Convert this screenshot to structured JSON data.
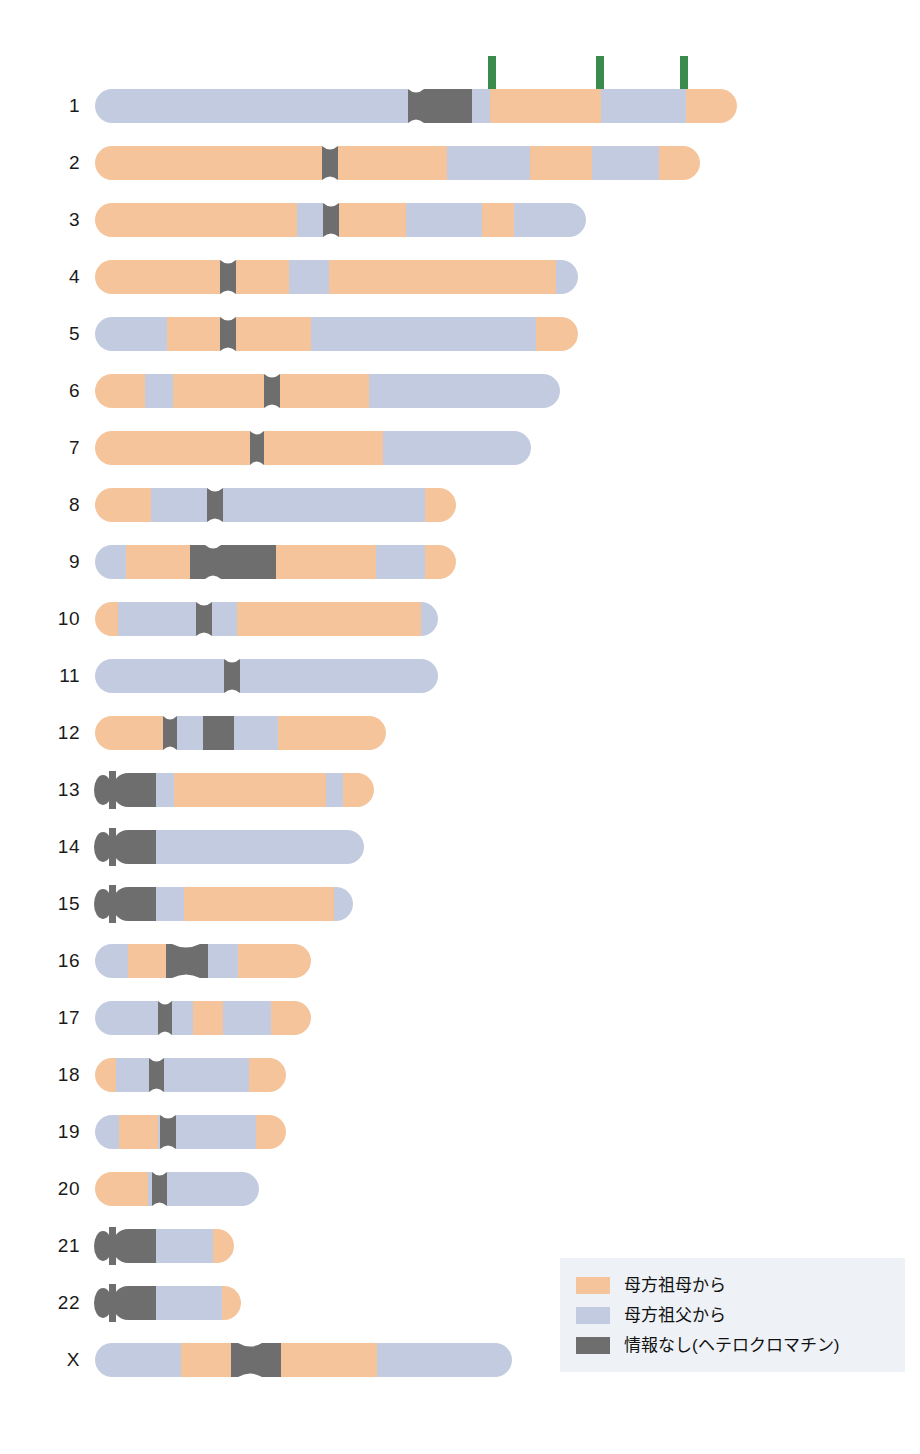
{
  "figure": {
    "type": "chromosome-ideogram-karyogram",
    "title": "",
    "background": "#ffffff"
  },
  "colors": {
    "maternal_grandmother": "#F5C49B",
    "maternal_grandfather": "#C2CBDF",
    "no_information": "#6E6E6E",
    "arrow": "#3C8B4E",
    "label_text": "#1a1a1a",
    "legend_background": "#eef1f5"
  },
  "legend": {
    "items": [
      {
        "swatch": "maternal_grandmother",
        "label": "母方祖母から"
      },
      {
        "swatch": "maternal_grandfather",
        "label": "母方祖父から"
      },
      {
        "swatch": "no_information",
        "label": "情報なし(ヘテロクロマチン)"
      }
    ]
  },
  "arrows": {
    "count": 3,
    "direction": "down",
    "points_at_chromosome": "1",
    "x_positions": [
      492,
      600,
      684
    ],
    "top": 56,
    "length": 50
  },
  "chart_data": {
    "type": "bar",
    "title": "",
    "xlabel": "",
    "ylabel": "",
    "categories": [
      "1",
      "2",
      "3",
      "4",
      "5",
      "6",
      "7",
      "8",
      "9",
      "10",
      "11",
      "12",
      "13",
      "14",
      "15",
      "16",
      "17",
      "18",
      "19",
      "20",
      "21",
      "22",
      "X"
    ],
    "note": "Each chromosome drawn to scale as a horizontal bar; bands give parental origin of each segment."
  },
  "chromosomes": [
    {
      "name": "1",
      "y": 106,
      "x0": 95,
      "x1": 737,
      "acrocentric": false,
      "centromere": {
        "start": 408,
        "end": 424
      },
      "bands": [
        {
          "from": 95,
          "to": 408,
          "color": "maternal_grandfather"
        },
        {
          "from": 408,
          "to": 472,
          "color": "no_information"
        },
        {
          "from": 472,
          "to": 490,
          "color": "maternal_grandfather"
        },
        {
          "from": 490,
          "to": 601,
          "color": "maternal_grandmother"
        },
        {
          "from": 601,
          "to": 686,
          "color": "maternal_grandfather"
        },
        {
          "from": 686,
          "to": 737,
          "color": "maternal_grandmother"
        }
      ]
    },
    {
      "name": "2",
      "y": 163,
      "x0": 95,
      "x1": 700,
      "acrocentric": false,
      "centromere": {
        "start": 322,
        "end": 338
      },
      "bands": [
        {
          "from": 95,
          "to": 322,
          "color": "maternal_grandmother"
        },
        {
          "from": 322,
          "to": 338,
          "color": "no_information"
        },
        {
          "from": 338,
          "to": 447,
          "color": "maternal_grandmother"
        },
        {
          "from": 447,
          "to": 530,
          "color": "maternal_grandfather"
        },
        {
          "from": 530,
          "to": 592,
          "color": "maternal_grandmother"
        },
        {
          "from": 592,
          "to": 659,
          "color": "maternal_grandfather"
        },
        {
          "from": 659,
          "to": 700,
          "color": "maternal_grandmother"
        }
      ]
    },
    {
      "name": "3",
      "y": 220,
      "x0": 95,
      "x1": 586,
      "acrocentric": false,
      "centromere": {
        "start": 323,
        "end": 339
      },
      "bands": [
        {
          "from": 95,
          "to": 297,
          "color": "maternal_grandmother"
        },
        {
          "from": 297,
          "to": 323,
          "color": "maternal_grandfather"
        },
        {
          "from": 323,
          "to": 339,
          "color": "no_information"
        },
        {
          "from": 339,
          "to": 406,
          "color": "maternal_grandmother"
        },
        {
          "from": 406,
          "to": 482,
          "color": "maternal_grandfather"
        },
        {
          "from": 482,
          "to": 514,
          "color": "maternal_grandmother"
        },
        {
          "from": 514,
          "to": 586,
          "color": "maternal_grandfather"
        }
      ]
    },
    {
      "name": "4",
      "y": 277,
      "x0": 95,
      "x1": 578,
      "acrocentric": false,
      "centromere": {
        "start": 220,
        "end": 236
      },
      "bands": [
        {
          "from": 95,
          "to": 220,
          "color": "maternal_grandmother"
        },
        {
          "from": 220,
          "to": 236,
          "color": "no_information"
        },
        {
          "from": 236,
          "to": 289,
          "color": "maternal_grandmother"
        },
        {
          "from": 289,
          "to": 329,
          "color": "maternal_grandfather"
        },
        {
          "from": 329,
          "to": 556,
          "color": "maternal_grandmother"
        },
        {
          "from": 556,
          "to": 578,
          "color": "maternal_grandfather"
        }
      ]
    },
    {
      "name": "5",
      "y": 334,
      "x0": 95,
      "x1": 578,
      "acrocentric": false,
      "centromere": {
        "start": 220,
        "end": 236
      },
      "bands": [
        {
          "from": 95,
          "to": 167,
          "color": "maternal_grandfather"
        },
        {
          "from": 167,
          "to": 220,
          "color": "maternal_grandmother"
        },
        {
          "from": 220,
          "to": 236,
          "color": "no_information"
        },
        {
          "from": 236,
          "to": 311,
          "color": "maternal_grandmother"
        },
        {
          "from": 311,
          "to": 536,
          "color": "maternal_grandfather"
        },
        {
          "from": 536,
          "to": 578,
          "color": "maternal_grandmother"
        }
      ]
    },
    {
      "name": "6",
      "y": 391,
      "x0": 95,
      "x1": 560,
      "acrocentric": false,
      "centromere": {
        "start": 264,
        "end": 280
      },
      "bands": [
        {
          "from": 95,
          "to": 145,
          "color": "maternal_grandmother"
        },
        {
          "from": 145,
          "to": 173,
          "color": "maternal_grandfather"
        },
        {
          "from": 173,
          "to": 264,
          "color": "maternal_grandmother"
        },
        {
          "from": 264,
          "to": 280,
          "color": "no_information"
        },
        {
          "from": 280,
          "to": 369,
          "color": "maternal_grandmother"
        },
        {
          "from": 369,
          "to": 560,
          "color": "maternal_grandfather"
        }
      ]
    },
    {
      "name": "7",
      "y": 448,
      "x0": 95,
      "x1": 531,
      "acrocentric": false,
      "centromere": {
        "start": 250,
        "end": 264
      },
      "bands": [
        {
          "from": 95,
          "to": 250,
          "color": "maternal_grandmother"
        },
        {
          "from": 250,
          "to": 264,
          "color": "no_information"
        },
        {
          "from": 264,
          "to": 383,
          "color": "maternal_grandmother"
        },
        {
          "from": 383,
          "to": 531,
          "color": "maternal_grandfather"
        }
      ]
    },
    {
      "name": "8",
      "y": 505,
      "x0": 95,
      "x1": 456,
      "acrocentric": false,
      "centromere": {
        "start": 207,
        "end": 223
      },
      "bands": [
        {
          "from": 95,
          "to": 151,
          "color": "maternal_grandmother"
        },
        {
          "from": 151,
          "to": 207,
          "color": "maternal_grandfather"
        },
        {
          "from": 207,
          "to": 223,
          "color": "no_information"
        },
        {
          "from": 223,
          "to": 425,
          "color": "maternal_grandfather"
        },
        {
          "from": 425,
          "to": 456,
          "color": "maternal_grandmother"
        }
      ]
    },
    {
      "name": "9",
      "y": 562,
      "x0": 95,
      "x1": 456,
      "acrocentric": false,
      "centromere": {
        "start": 205,
        "end": 221
      },
      "bands": [
        {
          "from": 95,
          "to": 126,
          "color": "maternal_grandfather"
        },
        {
          "from": 126,
          "to": 190,
          "color": "maternal_grandmother"
        },
        {
          "from": 190,
          "to": 276,
          "color": "no_information"
        },
        {
          "from": 276,
          "to": 376,
          "color": "maternal_grandmother"
        },
        {
          "from": 376,
          "to": 425,
          "color": "maternal_grandfather"
        },
        {
          "from": 425,
          "to": 456,
          "color": "maternal_grandmother"
        }
      ]
    },
    {
      "name": "10",
      "y": 619,
      "x0": 95,
      "x1": 438,
      "acrocentric": false,
      "centromere": {
        "start": 196,
        "end": 212
      },
      "bands": [
        {
          "from": 95,
          "to": 118,
          "color": "maternal_grandmother"
        },
        {
          "from": 118,
          "to": 196,
          "color": "maternal_grandfather"
        },
        {
          "from": 196,
          "to": 212,
          "color": "no_information"
        },
        {
          "from": 212,
          "to": 237,
          "color": "maternal_grandfather"
        },
        {
          "from": 237,
          "to": 421,
          "color": "maternal_grandmother"
        },
        {
          "from": 421,
          "to": 438,
          "color": "maternal_grandfather"
        }
      ]
    },
    {
      "name": "11",
      "y": 676,
      "x0": 95,
      "x1": 438,
      "acrocentric": false,
      "centromere": {
        "start": 224,
        "end": 240
      },
      "bands": [
        {
          "from": 95,
          "to": 224,
          "color": "maternal_grandfather"
        },
        {
          "from": 224,
          "to": 240,
          "color": "no_information"
        },
        {
          "from": 240,
          "to": 438,
          "color": "maternal_grandfather"
        }
      ]
    },
    {
      "name": "12",
      "y": 733,
      "x0": 95,
      "x1": 386,
      "acrocentric": false,
      "centromere": {
        "start": 163,
        "end": 177
      },
      "bands": [
        {
          "from": 95,
          "to": 163,
          "color": "maternal_grandmother"
        },
        {
          "from": 163,
          "to": 177,
          "color": "no_information"
        },
        {
          "from": 177,
          "to": 203,
          "color": "maternal_grandfather"
        },
        {
          "from": 203,
          "to": 234,
          "color": "no_information"
        },
        {
          "from": 234,
          "to": 278,
          "color": "maternal_grandfather"
        },
        {
          "from": 278,
          "to": 386,
          "color": "maternal_grandmother"
        }
      ]
    },
    {
      "name": "13",
      "y": 790,
      "x0": 95,
      "x1": 374,
      "acrocentric": true,
      "centromere": {
        "start": 140,
        "end": 156
      },
      "bands": [
        {
          "from": 95,
          "to": 156,
          "color": "no_information"
        },
        {
          "from": 156,
          "to": 174,
          "color": "maternal_grandfather"
        },
        {
          "from": 174,
          "to": 326,
          "color": "maternal_grandmother"
        },
        {
          "from": 326,
          "to": 343,
          "color": "maternal_grandfather"
        },
        {
          "from": 343,
          "to": 374,
          "color": "maternal_grandmother"
        }
      ]
    },
    {
      "name": "14",
      "y": 847,
      "x0": 95,
      "x1": 364,
      "acrocentric": true,
      "centromere": {
        "start": 140,
        "end": 156
      },
      "bands": [
        {
          "from": 95,
          "to": 156,
          "color": "no_information"
        },
        {
          "from": 156,
          "to": 364,
          "color": "maternal_grandfather"
        }
      ]
    },
    {
      "name": "15",
      "y": 904,
      "x0": 95,
      "x1": 353,
      "acrocentric": true,
      "centromere": {
        "start": 140,
        "end": 156
      },
      "bands": [
        {
          "from": 95,
          "to": 156,
          "color": "no_information"
        },
        {
          "from": 156,
          "to": 184,
          "color": "maternal_grandfather"
        },
        {
          "from": 184,
          "to": 334,
          "color": "maternal_grandmother"
        },
        {
          "from": 334,
          "to": 353,
          "color": "maternal_grandfather"
        }
      ]
    },
    {
      "name": "16",
      "y": 961,
      "x0": 95,
      "x1": 311,
      "acrocentric": false,
      "centromere": {
        "start": 172,
        "end": 200
      },
      "bands": [
        {
          "from": 95,
          "to": 128,
          "color": "maternal_grandfather"
        },
        {
          "from": 128,
          "to": 166,
          "color": "maternal_grandmother"
        },
        {
          "from": 166,
          "to": 208,
          "color": "no_information"
        },
        {
          "from": 208,
          "to": 238,
          "color": "maternal_grandfather"
        },
        {
          "from": 238,
          "to": 311,
          "color": "maternal_grandmother"
        }
      ]
    },
    {
      "name": "17",
      "y": 1018,
      "x0": 95,
      "x1": 311,
      "acrocentric": false,
      "centromere": {
        "start": 158,
        "end": 172
      },
      "bands": [
        {
          "from": 95,
          "to": 158,
          "color": "maternal_grandfather"
        },
        {
          "from": 158,
          "to": 172,
          "color": "no_information"
        },
        {
          "from": 172,
          "to": 193,
          "color": "maternal_grandfather"
        },
        {
          "from": 193,
          "to": 223,
          "color": "maternal_grandmother"
        },
        {
          "from": 223,
          "to": 271,
          "color": "maternal_grandfather"
        },
        {
          "from": 271,
          "to": 311,
          "color": "maternal_grandmother"
        }
      ]
    },
    {
      "name": "18",
      "y": 1075,
      "x0": 95,
      "x1": 286,
      "acrocentric": false,
      "centromere": {
        "start": 149,
        "end": 164
      },
      "bands": [
        {
          "from": 95,
          "to": 116,
          "color": "maternal_grandmother"
        },
        {
          "from": 116,
          "to": 149,
          "color": "maternal_grandfather"
        },
        {
          "from": 149,
          "to": 164,
          "color": "no_information"
        },
        {
          "from": 164,
          "to": 249,
          "color": "maternal_grandfather"
        },
        {
          "from": 249,
          "to": 286,
          "color": "maternal_grandmother"
        }
      ]
    },
    {
      "name": "19",
      "y": 1132,
      "x0": 95,
      "x1": 286,
      "acrocentric": false,
      "centromere": {
        "start": 160,
        "end": 176
      },
      "bands": [
        {
          "from": 95,
          "to": 119,
          "color": "maternal_grandfather"
        },
        {
          "from": 119,
          "to": 158,
          "color": "maternal_grandmother"
        },
        {
          "from": 158,
          "to": 160,
          "color": "maternal_grandfather"
        },
        {
          "from": 160,
          "to": 176,
          "color": "no_information"
        },
        {
          "from": 176,
          "to": 256,
          "color": "maternal_grandfather"
        },
        {
          "from": 256,
          "to": 286,
          "color": "maternal_grandmother"
        }
      ]
    },
    {
      "name": "20",
      "y": 1189,
      "x0": 95,
      "x1": 259,
      "acrocentric": false,
      "centromere": {
        "start": 152,
        "end": 167
      },
      "bands": [
        {
          "from": 95,
          "to": 148,
          "color": "maternal_grandmother"
        },
        {
          "from": 148,
          "to": 152,
          "color": "maternal_grandfather"
        },
        {
          "from": 152,
          "to": 167,
          "color": "no_information"
        },
        {
          "from": 167,
          "to": 259,
          "color": "maternal_grandfather"
        }
      ]
    },
    {
      "name": "21",
      "y": 1246,
      "x0": 95,
      "x1": 234,
      "acrocentric": true,
      "centromere": {
        "start": 140,
        "end": 156
      },
      "bands": [
        {
          "from": 95,
          "to": 156,
          "color": "no_information"
        },
        {
          "from": 156,
          "to": 213,
          "color": "maternal_grandfather"
        },
        {
          "from": 213,
          "to": 234,
          "color": "maternal_grandmother"
        }
      ]
    },
    {
      "name": "22",
      "y": 1303,
      "x0": 95,
      "x1": 241,
      "acrocentric": true,
      "centromere": {
        "start": 140,
        "end": 156
      },
      "bands": [
        {
          "from": 95,
          "to": 156,
          "color": "no_information"
        },
        {
          "from": 156,
          "to": 222,
          "color": "maternal_grandfather"
        },
        {
          "from": 222,
          "to": 241,
          "color": "maternal_grandmother"
        }
      ]
    },
    {
      "name": "X",
      "y": 1360,
      "x0": 95,
      "x1": 512,
      "acrocentric": false,
      "centromere": {
        "start": 238,
        "end": 262
      },
      "bands": [
        {
          "from": 95,
          "to": 181,
          "color": "maternal_grandfather"
        },
        {
          "from": 181,
          "to": 231,
          "color": "maternal_grandmother"
        },
        {
          "from": 231,
          "to": 281,
          "color": "no_information"
        },
        {
          "from": 281,
          "to": 377,
          "color": "maternal_grandmother"
        },
        {
          "from": 377,
          "to": 512,
          "color": "maternal_grandfather"
        }
      ]
    }
  ],
  "legend_box": {
    "x": 560,
    "y": 1258,
    "width": 345,
    "height": 104
  }
}
